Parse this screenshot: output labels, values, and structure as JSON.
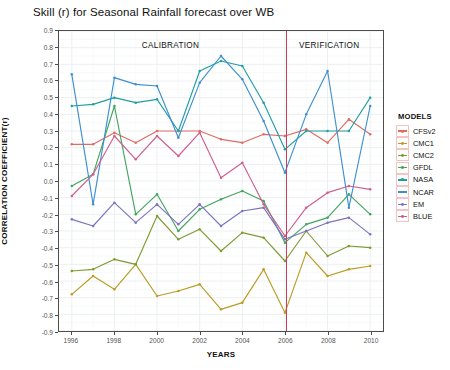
{
  "chart_data": {
    "type": "line",
    "title": "Skill (r) for Seasonal Rainfall forecast over WB",
    "xlabel": "YEARS",
    "ylabel": "CORRELATION COEFFICIENT(r)",
    "legend_title": "MODELS",
    "legend_position": "right",
    "grid": true,
    "xlim": [
      1995.4,
      2010.6
    ],
    "ylim": [
      -0.9,
      0.9
    ],
    "x": [
      1996,
      1997,
      1998,
      1999,
      2000,
      2001,
      2002,
      2003,
      2004,
      2005,
      2006,
      2007,
      2008,
      2009,
      2010
    ],
    "xticks": [
      1996,
      1998,
      2000,
      2002,
      2004,
      2006,
      2008,
      2010
    ],
    "xticks_all": [
      1996,
      1997,
      1998,
      1999,
      2000,
      2001,
      2002,
      2003,
      2004,
      2005,
      2006,
      2007,
      2008,
      2009,
      2010
    ],
    "yticks": [
      0.9,
      0.8,
      0.7,
      0.6,
      0.5,
      0.4,
      0.3,
      0.2,
      0.1,
      0.0,
      -0.1,
      -0.2,
      -0.3,
      -0.4,
      -0.5,
      -0.6,
      -0.7,
      -0.8,
      -0.9
    ],
    "annotations": [
      {
        "text": "CALIBRATION",
        "x": 2000.6,
        "y": 0.81
      },
      {
        "text": "VERIFICATION",
        "x": 2008.0,
        "y": 0.81
      }
    ],
    "divider": {
      "x": 2006,
      "color": "#c2405a",
      "label": "calibration-verification-divider"
    },
    "series": [
      {
        "name": "CFSv2",
        "color": "#e06c62",
        "values": [
          0.22,
          0.22,
          0.29,
          0.23,
          0.3,
          0.3,
          0.3,
          0.25,
          0.23,
          0.28,
          0.27,
          0.31,
          0.23,
          0.37,
          0.28
        ]
      },
      {
        "name": "CMC1",
        "color": "#bb9b22",
        "values": [
          -0.68,
          -0.57,
          -0.65,
          -0.5,
          -0.69,
          -0.66,
          -0.62,
          -0.77,
          -0.73,
          -0.53,
          -0.79,
          -0.43,
          -0.57,
          -0.53,
          -0.51
        ]
      },
      {
        "name": "CMC2",
        "color": "#7e9b2f",
        "values": [
          -0.54,
          -0.53,
          -0.47,
          -0.5,
          -0.21,
          -0.35,
          -0.29,
          -0.42,
          -0.31,
          -0.34,
          -0.48,
          -0.3,
          -0.45,
          -0.39,
          -0.4
        ]
      },
      {
        "name": "GFDL",
        "color": "#3fa65c",
        "values": [
          -0.03,
          0.04,
          0.45,
          -0.2,
          -0.08,
          -0.3,
          -0.17,
          -0.11,
          -0.06,
          -0.12,
          -0.37,
          -0.26,
          -0.22,
          -0.08,
          -0.2
        ]
      },
      {
        "name": "NASA",
        "color": "#1fa0a0",
        "values": [
          0.45,
          0.46,
          0.5,
          0.47,
          0.49,
          0.3,
          0.66,
          0.72,
          0.69,
          0.47,
          0.19,
          0.3,
          0.3,
          0.3,
          0.5
        ]
      },
      {
        "name": "NCAR",
        "color": "#3d8fd0",
        "values": [
          0.64,
          -0.14,
          0.62,
          0.58,
          0.57,
          0.26,
          0.59,
          0.75,
          0.61,
          0.36,
          0.05,
          0.4,
          0.66,
          -0.16,
          0.45
        ]
      },
      {
        "name": "EM",
        "color": "#7b73c0",
        "values": [
          -0.23,
          -0.27,
          -0.13,
          -0.25,
          -0.14,
          -0.26,
          -0.14,
          -0.27,
          -0.18,
          -0.16,
          -0.35,
          -0.3,
          -0.25,
          -0.22,
          -0.32
        ]
      },
      {
        "name": "BLUE",
        "color": "#d05e8c",
        "values": [
          -0.09,
          0.04,
          0.27,
          0.13,
          0.27,
          0.15,
          0.29,
          0.02,
          0.11,
          -0.14,
          -0.33,
          -0.16,
          -0.07,
          -0.03,
          -0.05
        ]
      }
    ]
  }
}
